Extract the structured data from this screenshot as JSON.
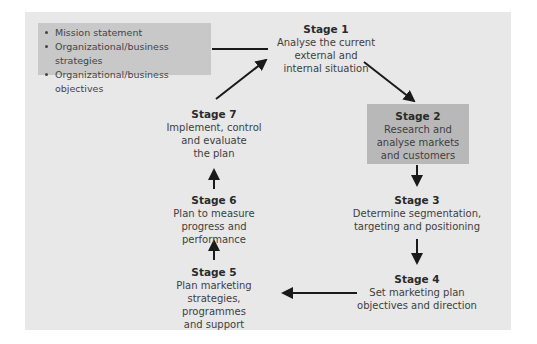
{
  "inputs": {
    "items": [
      "Mission statement",
      "Organizational/business strategies",
      "Organizational/business objectives"
    ]
  },
  "stages": [
    {
      "title": "Stage 1",
      "description": "Analyse the current\nexternal and\ninternal situation"
    },
    {
      "title": "Stage 2",
      "description": "Research and\nanalyse markets\nand customers"
    },
    {
      "title": "Stage 3",
      "description": "Determine segmentation,\ntargeting and positioning"
    },
    {
      "title": "Stage 4",
      "description": "Set marketing plan\nobjectives and direction"
    },
    {
      "title": "Stage 5",
      "description": "Plan marketing\nstrategies, programmes\nand support"
    },
    {
      "title": "Stage 6",
      "description": "Plan to measure\nprogress and performance"
    },
    {
      "title": "Stage 7",
      "description": "Implement, control\nand evaluate\nthe plan"
    }
  ],
  "colors": {
    "panel": "#e8e8e8",
    "highlight_box": "#c8c8c8",
    "stage2_box": "#b8b8b8",
    "arrow": "#1a1a1a"
  }
}
